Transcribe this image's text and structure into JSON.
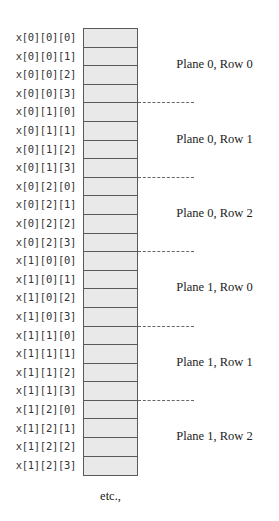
{
  "diagram": {
    "cell_fill": "#e9e9e9",
    "border_color": "#5a5a5a",
    "elements": [
      "x[0][0][0]",
      "x[0][0][1]",
      "x[0][0][2]",
      "x[0][0][3]",
      "x[0][1][0]",
      "x[0][1][1]",
      "x[0][1][2]",
      "x[0][1][3]",
      "x[0][2][0]",
      "x[0][2][1]",
      "x[0][2][2]",
      "x[0][2][3]",
      "x[1][0][0]",
      "x[1][0][1]",
      "x[1][0][2]",
      "x[1][0][3]",
      "x[1][1][0]",
      "x[1][1][1]",
      "x[1][1][2]",
      "x[1][1][3]",
      "x[1][2][0]",
      "x[1][2][1]",
      "x[1][2][2]",
      "x[1][2][3]"
    ],
    "groups": [
      "Plane 0, Row 0",
      "Plane 0, Row 1",
      "Plane 0, Row 2",
      "Plane 1, Row 0",
      "Plane 1, Row 1",
      "Plane 1, Row 2"
    ],
    "footer": "etc.,"
  }
}
